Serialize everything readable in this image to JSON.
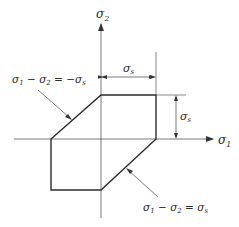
{
  "diagram": {
    "axes": {
      "x_label": "σ",
      "x_sub": "1",
      "y_label": "σ",
      "y_sub": "2"
    },
    "dimensions": {
      "horizontal": {
        "label": "σ",
        "sub": "s"
      },
      "vertical": {
        "label": "σ",
        "sub": "s"
      }
    },
    "annotations": [
      {
        "id": "upper-left",
        "text_a": "σ",
        "sub_a": "1",
        "op1": " − ",
        "text_b": "σ",
        "sub_b": "2",
        "op2": " = −",
        "text_c": "σ",
        "sub_c": "s"
      },
      {
        "id": "lower-right",
        "text_a": "σ",
        "sub_a": "1",
        "op1": " − ",
        "text_b": "σ",
        "sub_b": "2",
        "op2": " = ",
        "text_c": "σ",
        "sub_c": "s"
      }
    ],
    "colors": {
      "line": "#2b2b2b",
      "axis": "#555555"
    }
  }
}
